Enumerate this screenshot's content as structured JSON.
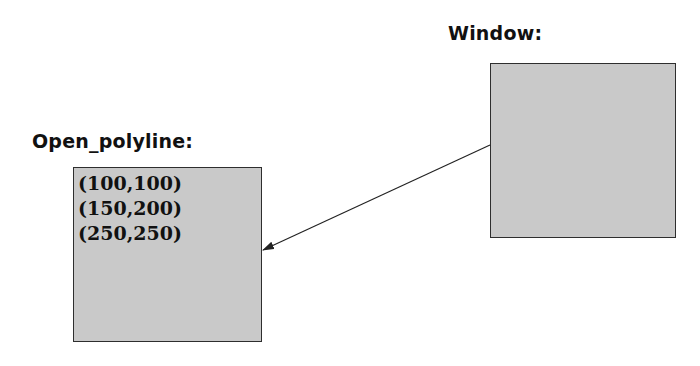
{
  "diagram": {
    "window": {
      "label": "Window:",
      "box": {
        "x": 490,
        "y": 63,
        "width": 186,
        "height": 175
      }
    },
    "open_polyline": {
      "label": "Open_polyline:",
      "box": {
        "x": 73,
        "y": 167,
        "width": 189,
        "height": 175
      },
      "points": [
        "(100,100)",
        "(150,200)",
        "(250,250)"
      ]
    },
    "arrow": {
      "from": {
        "x": 490,
        "y": 145
      },
      "to": {
        "x": 263,
        "y": 250
      },
      "meaning": "Window contains/references Open_polyline"
    },
    "colors": {
      "box_fill": "#c9c9c9",
      "box_border": "#2e2e2e",
      "text": "#111111",
      "arrow": "#222222"
    }
  }
}
